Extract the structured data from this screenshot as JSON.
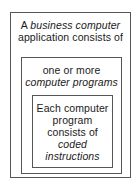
{
  "diagram": {
    "type": "nested-boxes",
    "colors": {
      "border": "#555555",
      "background": "#ffffff",
      "text": "#1a1a1a"
    },
    "levels": [
      {
        "id": "outer",
        "label": "business-application-box",
        "lines": [
          {
            "prefix": "A ",
            "emphasis": "business computer",
            "suffix": ""
          },
          {
            "prefix": "application consists of",
            "emphasis": "",
            "suffix": ""
          }
        ],
        "line1_prefix": "A ",
        "line1_emphasis": "business computer",
        "line2": "application consists of"
      },
      {
        "id": "middle",
        "label": "computer-programs-box",
        "line1": "one or more",
        "line2_emphasis": "computer programs"
      },
      {
        "id": "inner",
        "label": "coded-instructions-box",
        "line1": "Each computer",
        "line2": "program",
        "line3": "consists of",
        "line4_emphasis": "coded",
        "line5_emphasis": "instructions"
      }
    ]
  }
}
